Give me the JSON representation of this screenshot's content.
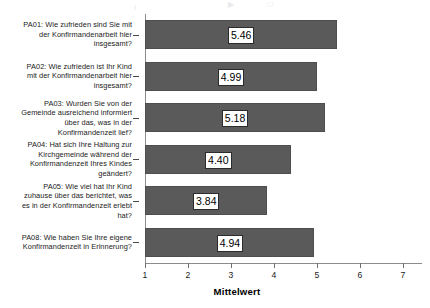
{
  "chart_data": {
    "type": "bar",
    "orientation": "horizontal",
    "title": "",
    "subtitle": "",
    "xlabel": "Mittelwert",
    "ylabel": "",
    "xlim": [
      1,
      7
    ],
    "xticks": [
      1,
      2,
      3,
      4,
      5,
      6,
      7
    ],
    "xticklabels": [
      "1",
      "2",
      "3",
      "4",
      "5",
      "6",
      "7"
    ],
    "grid": false,
    "legend": null,
    "bar_color": "#5a5a5a",
    "categories": [
      "PA01: Wie zufrieden sind Sie mit der Konfirmandenarbeit hier insgesamt?",
      "PA02: Wie zufrieden ist Ihr Kind mit der Konfirmandenarbeit hier insgesamt?",
      "PA03: Wurden Sie von der Gemeinde ausreichend informiert über das, was in der Konfirmandenzeit lief?",
      "PA04: Hat sich Ihre Haltung zur Kirchgemeinde während der Konfirmandenzeit Ihres Kindes geändert?",
      "PA05: Wie viel hat Ihr Kind zuhause über das berichtet, was es in der Konfirmandenzeit erlebt hat?",
      "PA08: Wie haben Sie Ihre eigene Konfirmandenzeit in Erinnerung?"
    ],
    "values": [
      5.46,
      4.99,
      5.18,
      4.4,
      3.84,
      4.94
    ],
    "value_labels": [
      "5.46",
      "4.99",
      "5.18",
      "4.40",
      "3.84",
      "4.94"
    ]
  },
  "categories_lines": [
    [
      "PA01: Wie zufrieden sind Sie mit",
      "der Konfirmandenarbeit hier",
      "insgesamt?"
    ],
    [
      "PA02: Wie zufrieden ist Ihr Kind",
      "mit der Konfirmandenarbeit hier",
      "insgesamt?"
    ],
    [
      "PA03: Wurden Sie von der",
      "Gemeinde ausreichend informiert",
      "über das, was in der",
      "Konfirmandenzeit lief?"
    ],
    [
      "PA04: Hat sich Ihre Haltung zur",
      "Kirchgemeinde während der",
      "Konfirmandenzeit Ihres Kindes",
      "geändert?"
    ],
    [
      "PA05: Wie viel hat Ihr Kind",
      "zuhause über das berichtet, was",
      "es in der Konfirmandenzeit erlebt",
      "hat?"
    ],
    [
      "PA08: Wie haben Sie Ihre eigene",
      "Konfirmandenzeit in Erinnerung?"
    ]
  ],
  "axis": {
    "x_title": "Mittelwert"
  }
}
